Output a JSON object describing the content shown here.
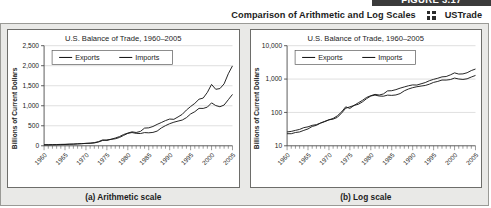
{
  "header": {
    "figure_banner": "FIGURE 3.17",
    "title": "Comparison of Arithmetic and Log Scales",
    "dataset_icon": "dataset-icon",
    "dataset_label": "USTrade"
  },
  "charts": [
    {
      "caption": "(a) Arithmetic scale",
      "chart_data": {
        "type": "line",
        "title": "U.S. Balance of Trade, 1960–2005",
        "xlabel": "",
        "ylabel": "Billions of Current Dollars",
        "scale": "linear",
        "grid": true,
        "legend_position": "top-left",
        "xlim": [
          1960,
          2005
        ],
        "ylim": [
          0,
          2500
        ],
        "yticks": [
          "0",
          "500",
          "1,000",
          "1,500",
          "2,000",
          "2,500"
        ],
        "ytick_values": [
          0,
          500,
          1000,
          1500,
          2000,
          2500
        ],
        "xticks": [
          "1960",
          "1965",
          "1970",
          "1975",
          "1980",
          "1985",
          "1990",
          "1995",
          "2000",
          "2005"
        ],
        "xtick_values": [
          1960,
          1965,
          1970,
          1975,
          1980,
          1985,
          1990,
          1995,
          2000,
          2005
        ],
        "x": [
          1960,
          1961,
          1962,
          1963,
          1964,
          1965,
          1966,
          1967,
          1968,
          1969,
          1970,
          1971,
          1972,
          1973,
          1974,
          1975,
          1976,
          1977,
          1978,
          1979,
          1980,
          1981,
          1982,
          1983,
          1984,
          1985,
          1986,
          1987,
          1988,
          1989,
          1990,
          1991,
          1992,
          1993,
          1994,
          1995,
          1996,
          1997,
          1998,
          1999,
          2000,
          2001,
          2002,
          2003,
          2004,
          2005
        ],
        "series": [
          {
            "name": "Exports",
            "values": [
              26,
              27,
              29,
              31,
              35,
              37,
              41,
              43,
              48,
              53,
              60,
              63,
              71,
              95,
              133,
              147,
              162,
              175,
              207,
              259,
              310,
              331,
              310,
              306,
              330,
              324,
              334,
              367,
              445,
              504,
              552,
              589,
              617,
              643,
              703,
              795,
              851,
              935,
              933,
              966,
              1072,
              1005,
              975,
              1018,
              1151,
              1283
            ],
            "style": "solid",
            "color": "#1a1a1a"
          },
          {
            "name": "Imports",
            "values": [
              23,
              23,
              25,
              26,
              29,
              32,
              38,
              41,
              48,
              54,
              60,
              66,
              79,
              103,
              147,
              132,
              162,
              194,
              230,
              282,
              317,
              348,
              332,
              358,
              442,
              448,
              482,
              534,
              581,
              630,
              668,
              661,
              721,
              785,
              893,
              981,
              1059,
              1163,
              1192,
              1334,
              1533,
              1411,
              1429,
              1547,
              1799,
              1997
            ],
            "style": "solid",
            "color": "#1a1a1a"
          }
        ]
      }
    },
    {
      "caption": "(b) Log scale",
      "chart_data": {
        "type": "line",
        "title": "U.S. Balance of Trade, 1960–2005",
        "xlabel": "",
        "ylabel": "Billions of Current Dollars",
        "scale": "log",
        "grid": true,
        "legend_position": "top-left",
        "xlim": [
          1960,
          2005
        ],
        "ylim": [
          10,
          10000
        ],
        "yticks": [
          "10",
          "100",
          "1,000",
          "10,000"
        ],
        "ytick_values": [
          10,
          100,
          1000,
          10000
        ],
        "xticks": [
          "1960",
          "1965",
          "1970",
          "1975",
          "1980",
          "1985",
          "1990",
          "1995",
          "2000",
          "2005"
        ],
        "xtick_values": [
          1960,
          1965,
          1970,
          1975,
          1980,
          1985,
          1990,
          1995,
          2000,
          2005
        ],
        "x": [
          1960,
          1961,
          1962,
          1963,
          1964,
          1965,
          1966,
          1967,
          1968,
          1969,
          1970,
          1971,
          1972,
          1973,
          1974,
          1975,
          1976,
          1977,
          1978,
          1979,
          1980,
          1981,
          1982,
          1983,
          1984,
          1985,
          1986,
          1987,
          1988,
          1989,
          1990,
          1991,
          1992,
          1993,
          1994,
          1995,
          1996,
          1997,
          1998,
          1999,
          2000,
          2001,
          2002,
          2003,
          2004,
          2005
        ],
        "series": [
          {
            "name": "Exports",
            "values": [
              26,
              27,
              29,
              31,
              35,
              37,
              41,
              43,
              48,
              53,
              60,
              63,
              71,
              95,
              133,
              147,
              162,
              175,
              207,
              259,
              310,
              331,
              310,
              306,
              330,
              324,
              334,
              367,
              445,
              504,
              552,
              589,
              617,
              643,
              703,
              795,
              851,
              935,
              933,
              966,
              1072,
              1005,
              975,
              1018,
              1151,
              1283
            ],
            "style": "solid",
            "color": "#1a1a1a"
          },
          {
            "name": "Imports",
            "values": [
              23,
              23,
              25,
              26,
              29,
              32,
              38,
              41,
              48,
              54,
              60,
              66,
              79,
              103,
              147,
              132,
              162,
              194,
              230,
              282,
              317,
              348,
              332,
              358,
              442,
              448,
              482,
              534,
              581,
              630,
              668,
              661,
              721,
              785,
              893,
              981,
              1059,
              1163,
              1192,
              1334,
              1533,
              1411,
              1429,
              1547,
              1799,
              1997
            ],
            "style": "solid",
            "color": "#1a1a1a"
          }
        ]
      }
    }
  ]
}
